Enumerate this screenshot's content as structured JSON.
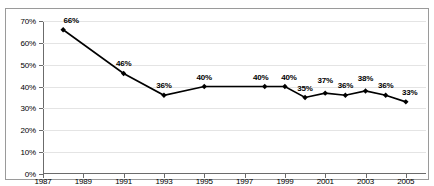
{
  "chart_data": {
    "type": "line",
    "title": "",
    "subtitle": "",
    "xlabel": "",
    "ylabel": "",
    "xlim": [
      1987,
      2006
    ],
    "ylim": [
      0,
      70
    ],
    "grid": true,
    "legend": "none",
    "y_tick_labels": [
      "0%",
      "10%",
      "20%",
      "30%",
      "40%",
      "50%",
      "60%",
      "70%"
    ],
    "y_tick_values": [
      0,
      10,
      20,
      30,
      40,
      50,
      60,
      70
    ],
    "x_tick_labels": [
      "1987",
      "1989",
      "1991",
      "1993",
      "1995",
      "1997",
      "1999",
      "2001",
      "2003",
      "2005"
    ],
    "x_tick_values": [
      1987,
      1989,
      1991,
      1993,
      1995,
      1997,
      1999,
      2001,
      2003,
      2005
    ],
    "series": [
      {
        "name": "percent",
        "marker": "diamond",
        "color": "#000000",
        "x": [
          1988,
          1991,
          1993,
          1995,
          1998,
          1999,
          2000,
          2001,
          2002,
          2003,
          2004,
          2005
        ],
        "values": [
          66,
          46,
          36,
          40,
          40,
          40,
          35,
          37,
          36,
          38,
          36,
          33
        ],
        "point_labels": [
          "66%",
          "46%",
          "36%",
          "40%",
          "40%",
          "40%",
          "35%",
          "37%",
          "36%",
          "38%",
          "36%",
          "33%"
        ]
      }
    ]
  },
  "colors": {
    "series_line": "#000000",
    "gridline": "#e4e4e4",
    "axis": "#6b6b6b",
    "frame": "#9a9a9a",
    "background": "#ffffff",
    "text": "#000000"
  }
}
